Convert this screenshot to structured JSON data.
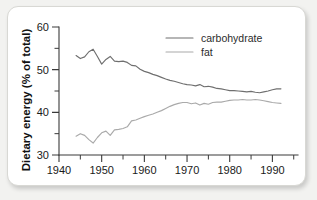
{
  "card": {
    "background_color": "#ffffff",
    "page_background_color": "#f2f2f0"
  },
  "chart_data": {
    "type": "line",
    "title": "",
    "xlabel": "",
    "ylabel": "Dietary energy (% of total)",
    "xlim": [
      1940,
      1996
    ],
    "ylim": [
      30,
      60
    ],
    "grid": false,
    "legend_position": "top-center-right",
    "x_ticks": [
      1940,
      1950,
      1960,
      1970,
      1980,
      1990
    ],
    "x_ticks_minor": [
      1945,
      1955,
      1965,
      1975,
      1985,
      1995
    ],
    "y_ticks": [
      30,
      40,
      50,
      60
    ],
    "y_ticks_minor": [
      35,
      45,
      55
    ],
    "x": [
      1944,
      1945,
      1946,
      1947,
      1948,
      1949,
      1950,
      1951,
      1952,
      1953,
      1954,
      1955,
      1956,
      1957,
      1958,
      1959,
      1960,
      1961,
      1962,
      1963,
      1964,
      1965,
      1966,
      1967,
      1968,
      1969,
      1970,
      1971,
      1972,
      1973,
      1974,
      1975,
      1976,
      1977,
      1978,
      1979,
      1980,
      1981,
      1982,
      1983,
      1984,
      1985,
      1986,
      1987,
      1988,
      1989,
      1990,
      1991,
      1992
    ],
    "series": [
      {
        "name": "carbohydrate",
        "color": "#6f6f6f",
        "values": [
          53.3,
          52.6,
          53.0,
          54.2,
          54.8,
          53.1,
          51.3,
          52.4,
          53.1,
          52.0,
          51.9,
          52.0,
          51.7,
          51.0,
          50.9,
          50.1,
          49.6,
          49.3,
          48.9,
          48.6,
          48.2,
          47.8,
          47.5,
          47.3,
          47.0,
          46.7,
          46.5,
          46.4,
          46.2,
          46.5,
          46.0,
          46.1,
          45.9,
          45.6,
          45.5,
          45.3,
          45.1,
          45.1,
          45.0,
          44.9,
          44.8,
          44.9,
          44.7,
          44.6,
          44.8,
          45.0,
          45.3,
          45.5,
          45.5
        ]
      },
      {
        "name": "fat",
        "color": "#aaaaaa",
        "values": [
          34.4,
          35.0,
          34.6,
          33.6,
          32.8,
          34.1,
          35.2,
          35.6,
          34.6,
          35.9,
          36.0,
          36.2,
          36.6,
          38.0,
          38.2,
          38.6,
          39.0,
          39.3,
          39.6,
          40.0,
          40.4,
          40.9,
          41.4,
          41.8,
          42.1,
          42.3,
          42.3,
          42.0,
          42.2,
          41.7,
          42.1,
          41.9,
          42.3,
          42.4,
          42.4,
          42.6,
          42.8,
          42.9,
          42.9,
          43.0,
          42.9,
          42.9,
          43.0,
          42.9,
          42.7,
          42.5,
          42.3,
          42.2,
          42.1
        ]
      }
    ]
  }
}
